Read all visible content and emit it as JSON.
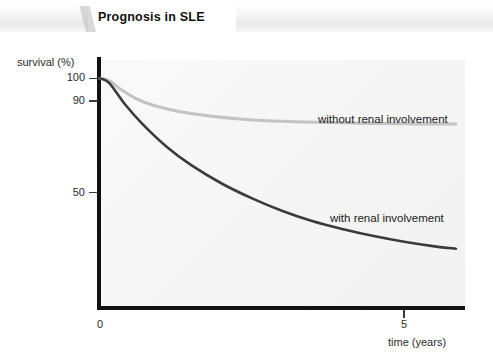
{
  "title": "Prognosis in SLE",
  "chart_data": {
    "type": "line",
    "title": "Prognosis in SLE",
    "xlabel": "time (years)",
    "ylabel": "survival (%)",
    "xlim": [
      0,
      6
    ],
    "ylim": [
      0,
      108
    ],
    "grid": false,
    "legend_position": "inline-annotation",
    "x_ticks": [
      {
        "value": 0,
        "label": "0"
      },
      {
        "value": 5,
        "label": "5"
      }
    ],
    "y_ticks": [
      {
        "value": 100,
        "label": "100"
      },
      {
        "value": 90,
        "label": "90"
      },
      {
        "value": 50,
        "label": "50"
      }
    ],
    "series": [
      {
        "name": "without renal involvement",
        "color": "#c3c3c3",
        "label_text": "without renal involvement",
        "x": [
          0.0,
          0.15,
          0.35,
          0.6,
          0.9,
          1.3,
          1.8,
          2.4,
          3.0,
          3.7,
          4.4,
          5.0,
          5.55,
          5.85
        ],
        "y": [
          100,
          99,
          95,
          91,
          88,
          85.5,
          83.5,
          82,
          81.2,
          80.7,
          80.3,
          80.1,
          80.0,
          80.0
        ]
      },
      {
        "name": "with renal involvement",
        "color": "#3b3b3b",
        "label_text": "with renal involvement",
        "x": [
          0.0,
          0.15,
          0.4,
          0.7,
          1.1,
          1.5,
          2.0,
          2.5,
          3.0,
          3.5,
          4.0,
          4.5,
          5.0,
          5.5,
          5.85
        ],
        "y": [
          100,
          98,
          89,
          80,
          70,
          62,
          54,
          47.5,
          42,
          37.5,
          34,
          31,
          28.5,
          26.5,
          25.5
        ]
      }
    ]
  }
}
